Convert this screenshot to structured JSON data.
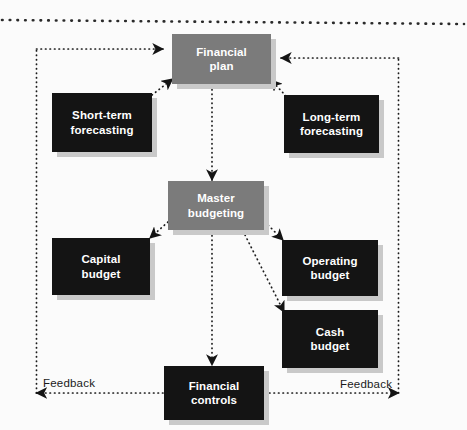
{
  "diagram": {
    "colors": {
      "dark_node": "#141414",
      "gray_node": "#7b7b7b",
      "node_text": "#ffffff",
      "connector": "#1a1a1a",
      "shadow": "#c9c9c9",
      "background": "#fbfbfb"
    },
    "nodes": [
      {
        "id": "financial-plan",
        "label": "Financial\nplan",
        "style": "gray"
      },
      {
        "id": "short-term-forecasting",
        "label": "Short-term\nforecasting",
        "style": "dark"
      },
      {
        "id": "long-term-forecasting",
        "label": "Long-term\nforecasting",
        "style": "dark"
      },
      {
        "id": "master-budgeting",
        "label": "Master\nbudgeting",
        "style": "gray"
      },
      {
        "id": "capital-budget",
        "label": "Capital\nbudget",
        "style": "dark"
      },
      {
        "id": "operating-budget",
        "label": "Operating\nbudget",
        "style": "dark"
      },
      {
        "id": "cash-budget",
        "label": "Cash\nbudget",
        "style": "dark"
      },
      {
        "id": "financial-controls",
        "label": "Financial\ncontrols",
        "style": "dark"
      }
    ],
    "feedback_left_label": "Feedback",
    "feedback_right_label": "Feedback",
    "edges": [
      {
        "from": "short-term-forecasting",
        "to": "financial-plan"
      },
      {
        "from": "long-term-forecasting",
        "to": "financial-plan"
      },
      {
        "from": "financial-plan",
        "to": "master-budgeting"
      },
      {
        "from": "master-budgeting",
        "to": "capital-budget"
      },
      {
        "from": "master-budgeting",
        "to": "operating-budget"
      },
      {
        "from": "master-budgeting",
        "to": "cash-budget"
      },
      {
        "from": "master-budgeting",
        "to": "financial-controls"
      },
      {
        "from": "financial-controls",
        "to": "feedback-left"
      },
      {
        "from": "financial-controls",
        "to": "feedback-right"
      },
      {
        "from": "feedback-left",
        "to": "financial-plan"
      },
      {
        "from": "feedback-right",
        "to": "financial-plan"
      }
    ]
  }
}
